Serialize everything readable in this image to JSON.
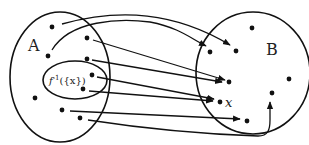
{
  "diagram": {
    "type": "function-mapping",
    "sets": [
      {
        "id": "A",
        "label": "A",
        "cx": 60,
        "cy": 77,
        "rx": 50,
        "ry": 65
      },
      {
        "id": "B",
        "label": "B",
        "cx": 253,
        "cy": 73,
        "rx": 57,
        "ry": 61
      }
    ],
    "subset": {
      "label": "f⁻¹({x})",
      "cx": 75,
      "cy": 80,
      "rx": 32,
      "ry": 19
    },
    "labels": {
      "set_a": "A",
      "set_b": "B",
      "preimage": "f⁻¹({x})",
      "preimage_base": "f",
      "preimage_sup": "-1",
      "preimage_arg": "({x})",
      "element_x": "x"
    },
    "points_a": [
      [
        52,
        27
      ],
      [
        87,
        38
      ],
      [
        48,
        56
      ],
      [
        87,
        59
      ],
      [
        92,
        75
      ],
      [
        83,
        89
      ],
      [
        35,
        98
      ],
      [
        62,
        110
      ],
      [
        80,
        118
      ]
    ],
    "points_b": [
      [
        252,
        28
      ],
      [
        210,
        52
      ],
      [
        236,
        51
      ],
      [
        289,
        79
      ],
      [
        229,
        82
      ],
      [
        272,
        93
      ],
      [
        220,
        102
      ],
      [
        247,
        121
      ]
    ],
    "arrows": [
      {
        "from": [
          52,
          27
        ],
        "to": [
          236,
          51
        ]
      },
      {
        "from": [
          48,
          56
        ],
        "to": [
          210,
          52
        ]
      },
      {
        "from": [
          87,
          38
        ],
        "to": [
          229,
          82
        ]
      },
      {
        "from": [
          87,
          59
        ],
        "to": [
          229,
          82
        ]
      },
      {
        "from": [
          92,
          75
        ],
        "to": [
          220,
          102
        ]
      },
      {
        "from": [
          83,
          89
        ],
        "to": [
          220,
          102
        ]
      },
      {
        "from": [
          62,
          110
        ],
        "to": [
          247,
          121
        ]
      },
      {
        "from": [
          80,
          118
        ],
        "to": [
          272,
          93
        ]
      }
    ]
  }
}
